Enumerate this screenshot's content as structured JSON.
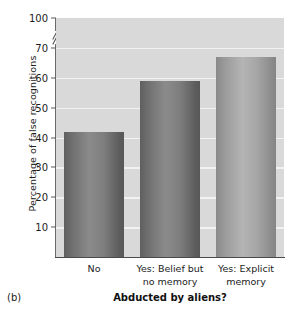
{
  "panel": {
    "label": "(b)"
  },
  "chart_data": {
    "type": "bar",
    "title": "",
    "subtitle": "",
    "xlabel": "Abducted by aliens?",
    "ylabel": "Percentage of false recognitions",
    "categories": [
      "No",
      "Yes: Belief but\nno memory",
      "Yes: Explicit\nmemory"
    ],
    "category_lines": [
      [
        "No"
      ],
      [
        "Yes: Belief but",
        "no memory"
      ],
      [
        "Yes: Explicit",
        "memory"
      ]
    ],
    "values": [
      42,
      59,
      67
    ],
    "value_unit": "percent",
    "ylim": [
      0,
      80
    ],
    "yticks": [
      10,
      20,
      30,
      40,
      50,
      60,
      70,
      100
    ],
    "ytick_labels": [
      "10",
      "20",
      "30",
      "40",
      "50",
      "60",
      "70",
      "100"
    ],
    "axis_break": {
      "present": true,
      "between": [
        70,
        100
      ],
      "axis": "y"
    },
    "grid": {
      "horizontal": true,
      "vertical": false,
      "color": "#f2f2f2"
    },
    "legend": {
      "present": false,
      "position": "none"
    },
    "colors": {
      "plot_background": "#d9d9d9",
      "bar_dark": "#7e7e7e",
      "bar_light": "#a6a6a6",
      "axis": "#4a4a4a",
      "text": "#1c1c1c"
    },
    "bar_styles": [
      "dark",
      "dark",
      "light"
    ]
  }
}
